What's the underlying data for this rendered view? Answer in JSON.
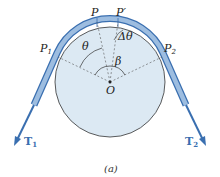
{
  "diagram": {
    "labels": {
      "P": "P",
      "P_prime": "P′",
      "P1": "P",
      "P1_sub": "1",
      "P2": "P",
      "P2_sub": "2",
      "theta": "θ",
      "delta_theta": "Δθ",
      "beta": "β",
      "origin": "O",
      "T1": "T",
      "T1_sub": "1",
      "T2": "T",
      "T2_sub": "2"
    },
    "caption": "(a)",
    "colors": {
      "drum_fill": "#dce9f3",
      "belt_fill": "#8fb3d9",
      "belt_stroke": "#3a6fb0",
      "arrow": "#3a6fb0",
      "outline": "#333333"
    }
  }
}
